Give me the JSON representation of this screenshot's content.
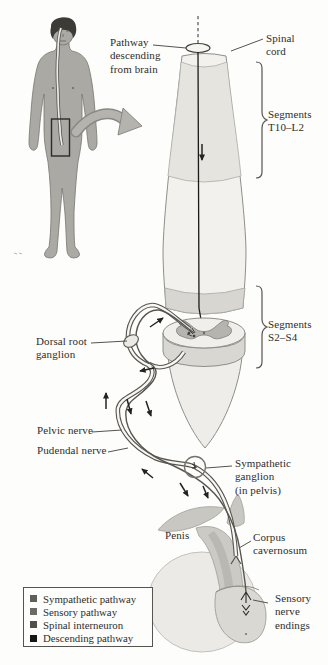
{
  "figure": {
    "colors": {
      "paper": "#fdfdfc",
      "ink": "#2e2d2a",
      "cord_light": "#f2f1ed",
      "cord_band_t10_l2": "#e5e4df",
      "cord_cut_band": "#d7d6d1",
      "gray_matter": "#b5b4af",
      "body_silhouette": "#aaa9a4",
      "pathway_line": "#56554f",
      "zoom_arrow": "#b4b3ae"
    },
    "labels": {
      "pathway_descending": [
        "Pathway",
        "descending",
        "from brain"
      ],
      "spinal_cord": [
        "Spinal",
        "cord"
      ],
      "segments_t10_l2": [
        "Segments",
        "T10–L2"
      ],
      "segments_s2_s4": [
        "Segments",
        "S2–S4"
      ],
      "dorsal_root_ganglion": [
        "Dorsal root",
        "ganglion"
      ],
      "pelvic_nerve": [
        "Pelvic nerve"
      ],
      "pudendal_nerve": [
        "Pudendal nerve"
      ],
      "sympathetic_ganglion": [
        "Sympathetic",
        "ganglion",
        "(in pelvis)"
      ],
      "penis": [
        "Penis"
      ],
      "corpus_cavernosum": [
        "Corpus",
        "cavernosum"
      ],
      "sensory_nerve_endings": [
        "Sensory",
        "nerve",
        "endings"
      ]
    },
    "legend": {
      "items": [
        {
          "label": "Sympathetic pathway",
          "color": "#5f5e59"
        },
        {
          "label": "Sensory pathway",
          "color": "#6b6a65"
        },
        {
          "label": "Spinal interneuron",
          "color": "#504f4a"
        },
        {
          "label": "Descending pathway",
          "color": "#161614"
        }
      ]
    }
  }
}
